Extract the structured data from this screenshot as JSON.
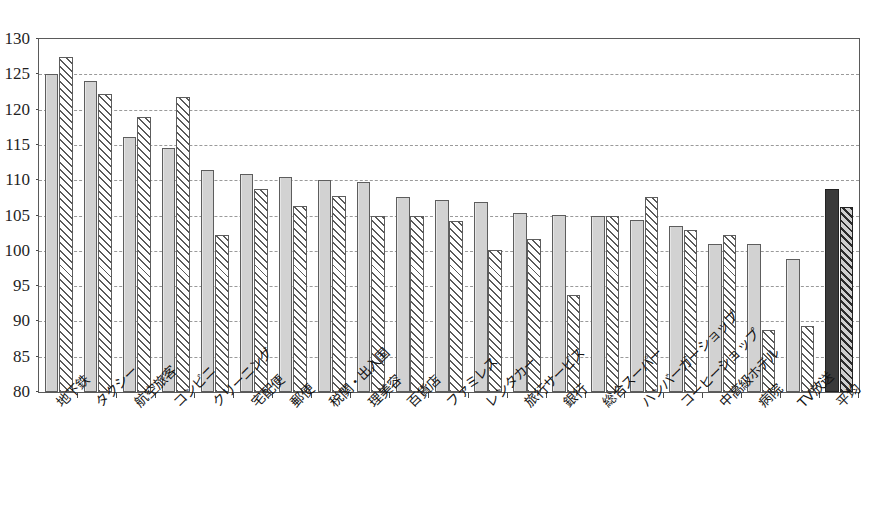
{
  "chart_data": {
    "type": "bar",
    "title": "",
    "xlabel": "",
    "ylabel": "",
    "ylim": [
      80,
      130
    ],
    "ytick_step": 5,
    "yticks": [
      "130",
      "125",
      "120",
      "115",
      "110",
      "105",
      "100",
      "95",
      "90",
      "85",
      "80"
    ],
    "grid": true,
    "legend_position": "none",
    "categories": [
      "地下鉄",
      "タクシー",
      "航空旅客",
      "コンビニ",
      "クリーニング",
      "宅配便",
      "郵便",
      "税関・出入国",
      "理美容",
      "百貨店",
      "ファミレス",
      "レンタカー",
      "旅行サービス",
      "銀行",
      "総合スーパー",
      "ハンバーガーショップ",
      "コーヒーショップ",
      "中高級ホテル",
      "病院",
      "TV放送",
      "平均"
    ],
    "series": [
      {
        "name": "series-1",
        "style": "solid-gray",
        "values": [
          125.0,
          124.0,
          116.1,
          114.5,
          111.5,
          110.9,
          110.4,
          110.0,
          109.7,
          107.6,
          107.2,
          106.9,
          105.3,
          105.1,
          104.9,
          104.3,
          103.5,
          101.0,
          101.0,
          98.8,
          108.8
        ]
      },
      {
        "name": "series-2",
        "style": "hatched",
        "values": [
          127.4,
          122.2,
          119.0,
          121.8,
          102.2,
          108.7,
          106.3,
          107.7,
          105.0,
          105.0,
          104.2,
          100.1,
          101.7,
          93.7,
          105.0,
          107.6,
          102.9,
          102.3,
          88.8,
          89.4,
          106.2
        ]
      }
    ],
    "highlight_category": "平均",
    "highlight_note": "last group rendered in dark fill"
  },
  "colors": {
    "bar_solid": "#d2d2d2",
    "bar_hatch_line": "#5a5a5a",
    "bar_dark": "#3a3a3a",
    "frame": "#5a5a5a",
    "gridline": "#9a9a9a",
    "text": "#141414"
  }
}
